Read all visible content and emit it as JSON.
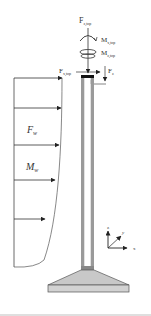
{
  "diagram": {
    "type": "structural-load-diagram",
    "labels": {
      "fz_top": "F",
      "fz_top_sub": "z,top",
      "mx_top": "M",
      "mx_top_sub": "x,top",
      "mz_top": "M",
      "mz_top_sub": "z,top",
      "fx_top": "F",
      "fx_top_sub": "x,top",
      "fz": "F",
      "fz_sub": "z",
      "fw": "F",
      "fw_sub": "w",
      "mw": "M",
      "mw_sub": "w"
    },
    "axes": {
      "z": "z",
      "y": "y",
      "x": "x"
    },
    "colors": {
      "line": "#333333",
      "post_fill": "#9a9a9a",
      "base_fill": "#c8c8c8",
      "cap": "#111111",
      "rule": "#bfbfbf"
    }
  }
}
